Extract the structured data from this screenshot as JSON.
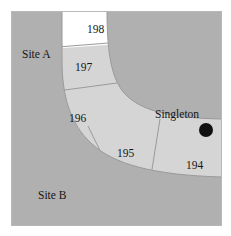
{
  "figure": {
    "type": "map",
    "background_color": "#ffffff",
    "frame_color": "#b5b5b5",
    "land_color": "#b0b0b0",
    "terrace_band_color": "#d5d5d5",
    "highlight_unit_color": "#ffffff",
    "boundary_line_color": "#8f8f8f",
    "marker_color": "#111111",
    "text_color": "#161616"
  },
  "site_labels": [
    {
      "id": "site-a",
      "text": "Site A",
      "x": 22,
      "y": 49
    },
    {
      "id": "site-b",
      "text": "Site B",
      "x": 38,
      "y": 190
    }
  ],
  "unit_labels": [
    {
      "id": "unit-198",
      "text": "198",
      "x": 87,
      "y": 24
    },
    {
      "id": "unit-197",
      "text": "197",
      "x": 75,
      "y": 62
    },
    {
      "id": "unit-196",
      "text": "196",
      "x": 69,
      "y": 113
    },
    {
      "id": "unit-195",
      "text": "195",
      "x": 117,
      "y": 148
    },
    {
      "id": "unit-194",
      "text": "194",
      "x": 186,
      "y": 160
    }
  ],
  "point_features": [
    {
      "id": "singleton",
      "text": "Singleton",
      "label_x": 155,
      "label_y": 109,
      "marker_x": 206,
      "marker_y": 130,
      "marker_radius": 7
    }
  ],
  "geometry": {
    "frame": {
      "x": 11,
      "y": 11,
      "width": 211,
      "height": 215
    },
    "terrace_units": [
      {
        "id": "unit-198",
        "fill": "#ffffff"
      },
      {
        "id": "unit-197",
        "fill": "#d5d5d5"
      },
      {
        "id": "unit-196",
        "fill": "#d5d5d5"
      },
      {
        "id": "unit-195",
        "fill": "#d5d5d5"
      },
      {
        "id": "unit-194",
        "fill": "#d5d5d5"
      }
    ]
  }
}
